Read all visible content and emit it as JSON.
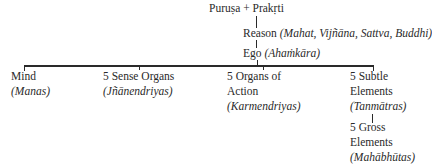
{
  "root": {
    "label": "Puruṣa + Prakṛti"
  },
  "level1": {
    "label": "Reason",
    "synonyms": "(Mahat, Vijñāna, Sattva, Buddhi)"
  },
  "level2": {
    "label": "Ego",
    "synonyms": "(Ahaṁkāra)"
  },
  "children": [
    {
      "line1": "Mind",
      "line2": "",
      "sanskrit": "(Manas)"
    },
    {
      "line1": "5 Sense Organs",
      "line2": "",
      "sanskrit": "(Jñānendriyas)"
    },
    {
      "line1": "5 Organs of",
      "line2": "Action",
      "sanskrit": "(Karmendriyas)"
    },
    {
      "line1": "5 Subtle",
      "line2": "Elements",
      "sanskrit": "(Tanmātras)"
    }
  ],
  "subchild": {
    "line1": "5 Gross",
    "line2": "Elements",
    "sanskrit": "(Mahābhūtas)"
  }
}
